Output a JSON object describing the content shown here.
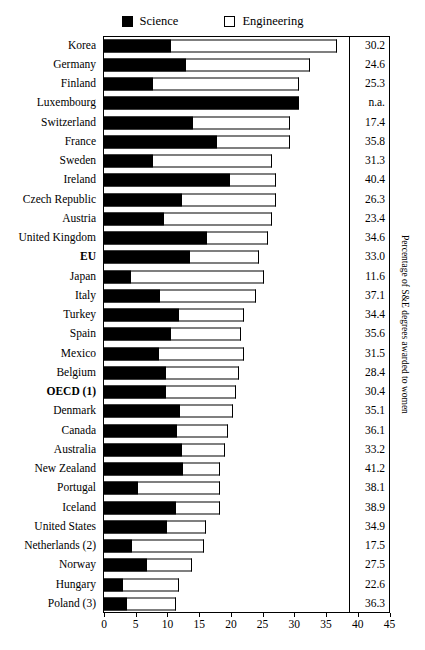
{
  "legend": {
    "items": [
      {
        "label": "Science",
        "icon": "filled-square-icon",
        "color": "#000000"
      },
      {
        "label": "Engineering",
        "icon": "empty-square-icon",
        "color": "#ffffff"
      }
    ]
  },
  "axis": {
    "y_title": "Percentage of S&E degrees awarded to women",
    "x_ticks": [
      "0",
      "5",
      "10",
      "15",
      "20",
      "25",
      "30",
      "35",
      "40",
      "45"
    ]
  },
  "chart_data": {
    "type": "bar",
    "orientation": "horizontal",
    "stacked": true,
    "title": "",
    "xlabel": "",
    "ylabel": "",
    "xlim": [
      0,
      45
    ],
    "grid": false,
    "legend_position": "top-center",
    "categories": [
      "Korea",
      "Germany",
      "Finland",
      "Luxembourg",
      "Switzerland",
      "France",
      "Sweden",
      "Ireland",
      "Czech Republic",
      "Austria",
      "United Kingdom",
      "EU",
      "Japan",
      "Italy",
      "Turkey",
      "Spain",
      "Mexico",
      "Belgium",
      "OECD (1)",
      "Denmark",
      "Canada",
      "Australia",
      "New Zealand",
      "Portugal",
      "Iceland",
      "United States",
      "Netherlands (2)",
      "Norway",
      "Hungary",
      "Poland (3)"
    ],
    "bold_categories": [
      "EU",
      "OECD (1)"
    ],
    "series": [
      {
        "name": "Science",
        "values": [
          10.5,
          13.0,
          7.7,
          30.8,
          14.0,
          17.8,
          7.8,
          19.8,
          12.3,
          9.5,
          16.2,
          13.5,
          4.3,
          8.9,
          11.8,
          10.5,
          8.6,
          9.7,
          9.8,
          12.0,
          11.5,
          12.3,
          12.5,
          5.3,
          11.3,
          10.0,
          4.4,
          6.7,
          3.0,
          3.6
        ]
      },
      {
        "name": "Engineering",
        "values": [
          26.3,
          19.5,
          23.0,
          0.0,
          15.3,
          11.5,
          18.7,
          7.3,
          14.8,
          17.0,
          9.6,
          11.0,
          21.0,
          15.1,
          10.2,
          11.1,
          13.5,
          11.6,
          11.0,
          8.4,
          8.0,
          6.7,
          5.8,
          13.0,
          7.0,
          6.0,
          11.3,
          7.2,
          8.8,
          7.8
        ]
      }
    ],
    "totals": [
      36.8,
      32.5,
      30.7,
      30.8,
      29.3,
      29.3,
      26.5,
      27.1,
      27.1,
      26.5,
      25.8,
      24.5,
      25.3,
      24.0,
      22.0,
      21.6,
      22.1,
      21.3,
      20.8,
      20.4,
      19.5,
      19.0,
      18.3,
      18.3,
      18.3,
      16.0,
      15.7,
      13.9,
      11.8,
      11.4
    ],
    "value_labels": [
      "30.2",
      "24.6",
      "25.3",
      "n.a.",
      "17.4",
      "35.8",
      "31.3",
      "40.4",
      "26.3",
      "23.4",
      "34.6",
      "33.0",
      "11.6",
      "37.1",
      "34.4",
      "35.6",
      "31.5",
      "28.4",
      "30.4",
      "35.1",
      "36.1",
      "33.2",
      "41.2",
      "38.1",
      "38.9",
      "34.9",
      "17.5",
      "27.5",
      "22.6",
      "36.3"
    ]
  }
}
